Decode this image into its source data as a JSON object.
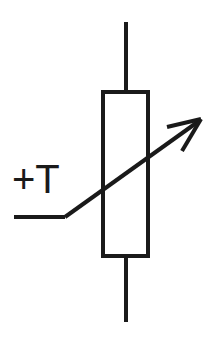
{
  "diagram": {
    "canvas": {
      "width": 210,
      "height": 337,
      "background": "#ffffff"
    },
    "colors": {
      "line": "#1a1a1a",
      "background": "#ffffff"
    },
    "stroke": {
      "body_width": 4,
      "lead_width": 4,
      "arrow_width": 4,
      "arrowhead_width": 4
    },
    "label": {
      "text": "+T",
      "plus": "+",
      "letter": "T",
      "x": 12,
      "y": 193,
      "font_size": 40,
      "color": "#1a1a1a"
    },
    "body": {
      "name": "resistor-body",
      "x": 103,
      "y": 92,
      "width": 45,
      "height": 164
    },
    "leads": [
      {
        "name": "top-lead",
        "x1": 126,
        "y1": 22,
        "x2": 126,
        "y2": 92
      },
      {
        "name": "bottom-lead",
        "x1": 126,
        "y1": 256,
        "x2": 126,
        "y2": 322
      }
    ],
    "arrow": {
      "name": "variability-arrow",
      "horizontal_segment": {
        "x1": 14,
        "y1": 217,
        "x2": 65,
        "y2": 217
      },
      "diagonal_segment": {
        "x1": 65,
        "y1": 217,
        "x2": 199,
        "y2": 121
      },
      "head": {
        "tip": {
          "x": 201,
          "y": 119
        },
        "barb_upper": {
          "x": 167,
          "y": 127
        },
        "barb_lower": {
          "x": 182,
          "y": 151
        }
      }
    }
  }
}
